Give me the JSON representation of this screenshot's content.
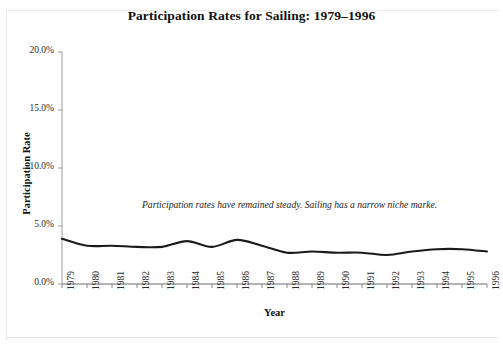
{
  "chart_data": {
    "type": "line",
    "title": "Participation Rates for Sailing: 1979–1996",
    "xlabel": "Year",
    "ylabel": "Participation Rate",
    "categories": [
      "1979",
      "1980",
      "1981",
      "1982",
      "1983",
      "1984",
      "1985",
      "1986",
      "1987",
      "1988",
      "1989",
      "1990",
      "1991",
      "1992",
      "1993",
      "1994",
      "1995",
      "1996"
    ],
    "x": [
      1979,
      1980,
      1981,
      1982,
      1983,
      1984,
      1985,
      1986,
      1987,
      1988,
      1989,
      1990,
      1991,
      1992,
      1993,
      1994,
      1995,
      1996
    ],
    "values": [
      3.9,
      3.3,
      3.3,
      3.2,
      3.2,
      3.7,
      3.2,
      3.8,
      3.3,
      2.7,
      2.8,
      2.7,
      2.7,
      2.5,
      2.8,
      3.0,
      3.0,
      2.8
    ],
    "series": [
      {
        "name": "Participation Rate",
        "values": [
          3.9,
          3.3,
          3.3,
          3.2,
          3.2,
          3.7,
          3.2,
          3.8,
          3.3,
          2.7,
          2.8,
          2.7,
          2.7,
          2.5,
          2.8,
          3.0,
          3.0,
          2.8
        ],
        "color": "#1a1a1a"
      }
    ],
    "ylim": [
      0,
      20
    ],
    "ytick_values": [
      0,
      5,
      10,
      15,
      20
    ],
    "ytick_labels": [
      "0.0%",
      "5.0%",
      "10.0%",
      "15.0%",
      "20.0%"
    ],
    "grid": false,
    "legend": false,
    "legend_position": "none",
    "annotations": [
      {
        "text": "Participation rates have remained steady.  Sailing has a narrow niche marke.",
        "x": 1983,
        "y": 6.5,
        "style": "italic"
      }
    ]
  },
  "footer": {
    "ghost_text": ""
  }
}
